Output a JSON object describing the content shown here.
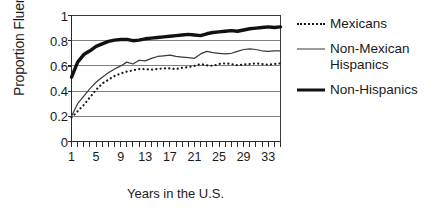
{
  "chart_data": {
    "type": "line",
    "title": "",
    "xlabel": "Years in the U.S.",
    "ylabel": "Proportion Fluent",
    "xlim": [
      1,
      35
    ],
    "ylim": [
      0,
      1
    ],
    "grid": true,
    "grid_axis": "y",
    "legend_position": "right",
    "ytick_labels": [
      "1",
      "0.8",
      "0.6",
      "0.4",
      "0.2",
      "0"
    ],
    "ytick_values": [
      1,
      0.8,
      0.6,
      0.4,
      0.2,
      0
    ],
    "xtick_labels": [
      "1",
      "5",
      "9",
      "13",
      "17",
      "21",
      "25",
      "29",
      "33"
    ],
    "xtick_values": [
      1,
      5,
      9,
      13,
      17,
      21,
      25,
      29,
      33
    ],
    "x": [
      1,
      2,
      3,
      4,
      5,
      6,
      7,
      8,
      9,
      10,
      11,
      12,
      13,
      14,
      15,
      16,
      17,
      18,
      19,
      20,
      21,
      22,
      23,
      24,
      25,
      26,
      27,
      28,
      29,
      30,
      31,
      32,
      33,
      34,
      35
    ],
    "series": [
      {
        "name": "Mexicans",
        "style": "dotted",
        "color": "#1a1a1a",
        "width": 2.2,
        "values": [
          0.19,
          0.24,
          0.29,
          0.35,
          0.41,
          0.46,
          0.49,
          0.52,
          0.54,
          0.555,
          0.565,
          0.575,
          0.575,
          0.57,
          0.575,
          0.58,
          0.58,
          0.575,
          0.585,
          0.59,
          0.6,
          0.615,
          0.605,
          0.6,
          0.615,
          0.62,
          0.615,
          0.605,
          0.61,
          0.615,
          0.62,
          0.615,
          0.61,
          0.615,
          0.62
        ]
      },
      {
        "name": "Non-Mexican Hispanics",
        "style": "solid-thin",
        "color": "#3a3a3a",
        "width": 1.2,
        "values": [
          0.2,
          0.3,
          0.36,
          0.42,
          0.47,
          0.51,
          0.545,
          0.575,
          0.6,
          0.63,
          0.615,
          0.645,
          0.64,
          0.66,
          0.675,
          0.68,
          0.685,
          0.675,
          0.67,
          0.665,
          0.66,
          0.695,
          0.715,
          0.705,
          0.7,
          0.695,
          0.7,
          0.715,
          0.73,
          0.735,
          0.73,
          0.72,
          0.715,
          0.72,
          0.72
        ]
      },
      {
        "name": "Non-Hispanics",
        "style": "solid-thick",
        "color": "#111111",
        "width": 3.4,
        "values": [
          0.51,
          0.63,
          0.69,
          0.72,
          0.755,
          0.775,
          0.795,
          0.805,
          0.81,
          0.81,
          0.8,
          0.805,
          0.815,
          0.82,
          0.825,
          0.83,
          0.835,
          0.84,
          0.845,
          0.85,
          0.845,
          0.84,
          0.855,
          0.865,
          0.87,
          0.875,
          0.88,
          0.875,
          0.885,
          0.895,
          0.9,
          0.905,
          0.91,
          0.905,
          0.91
        ]
      }
    ]
  },
  "legend": {
    "entries": [
      {
        "label": "Mexicans",
        "label_line2": ""
      },
      {
        "label": "Non-Mexican",
        "label_line2": "Hispanics"
      },
      {
        "label": "Non-Hispanics",
        "label_line2": ""
      }
    ]
  }
}
